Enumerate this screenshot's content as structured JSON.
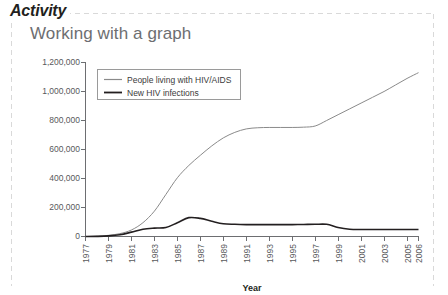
{
  "panel": {
    "activity_label": "Activity",
    "subtitle": "Working with a graph",
    "border_color": "#d9d9d9"
  },
  "chart_data": {
    "type": "line",
    "title": "Working with a graph",
    "xlabel": "Year",
    "ylabel": "",
    "xlim": [
      1977,
      2006
    ],
    "ylim": [
      0,
      1200000
    ],
    "grid": false,
    "legend_position": "top-left-inside",
    "x": [
      1977,
      1978,
      1979,
      1980,
      1981,
      1982,
      1983,
      1984,
      1985,
      1986,
      1987,
      1988,
      1989,
      1990,
      1991,
      1992,
      1993,
      1994,
      1995,
      1996,
      1997,
      1998,
      1999,
      2000,
      2001,
      2002,
      2003,
      2004,
      2005,
      2006
    ],
    "xticks": [
      "1977",
      "1979",
      "1981",
      "1983",
      "1985",
      "1987",
      "1989",
      "1991",
      "1993",
      "1995",
      "1997",
      "1999",
      "2001",
      "2003",
      "2005",
      "2006"
    ],
    "yticks": [
      "0",
      "200,000",
      "400,000",
      "600,000",
      "800,000",
      "1,000,000",
      "1,200,000"
    ],
    "series": [
      {
        "name": "People living with HIV/AIDS",
        "color": "#8a8a8a",
        "values": [
          0,
          2000,
          8000,
          20000,
          45000,
          95000,
          175000,
          290000,
          405000,
          490000,
          560000,
          625000,
          680000,
          718000,
          742000,
          750000,
          752000,
          752000,
          752000,
          754000,
          762000,
          800000,
          840000,
          880000,
          920000,
          960000,
          1000000,
          1045000,
          1090000,
          1130000
        ]
      },
      {
        "name": "New HIV infections",
        "color": "#231f20",
        "values": [
          0,
          1000,
          4000,
          12000,
          30000,
          50000,
          58000,
          62000,
          95000,
          130000,
          125000,
          105000,
          88000,
          84000,
          82000,
          82000,
          82000,
          82000,
          82000,
          83000,
          84000,
          84000,
          62000,
          50000,
          48000,
          48000,
          48000,
          48000,
          48000,
          48000
        ]
      }
    ]
  },
  "legend": {
    "entries": [
      {
        "label": "People living with HIV/AIDS"
      },
      {
        "label": "New HIV infections"
      }
    ]
  },
  "axis": {
    "x_title": "Year"
  }
}
